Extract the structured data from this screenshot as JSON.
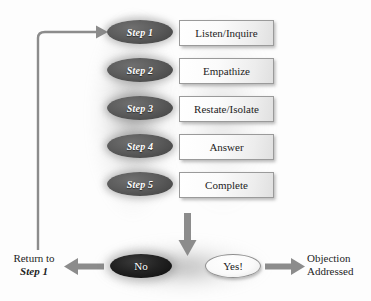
{
  "diagram": {
    "colors": {
      "background": "#fdfdfd",
      "step_ellipse": "#4a4a4a",
      "step_ellipse_text": "#ffffff",
      "box_fill": "#f2f2f2",
      "box_border": "#9a9a9a",
      "box_text": "#1d1d1d",
      "no_ellipse": "#141414",
      "yes_ellipse": "#fafafa",
      "arrow": "#8c8c8c",
      "return_line": "#8c8c8c"
    },
    "steps": [
      {
        "marker": "Step 1",
        "action": "Listen/Inquire"
      },
      {
        "marker": "Step 2",
        "action": "Empathize"
      },
      {
        "marker": "Step 3",
        "action": "Restate/Isolate"
      },
      {
        "marker": "Step 4",
        "action": "Answer"
      },
      {
        "marker": "Step 5",
        "action": "Complete"
      }
    ],
    "decisions": {
      "no_label": "No",
      "yes_label": "Yes!"
    },
    "outcomes": {
      "left_line1": "Return to",
      "left_line2": "Step 1",
      "right_line1": "Objection",
      "right_line2": "Addressed"
    }
  }
}
